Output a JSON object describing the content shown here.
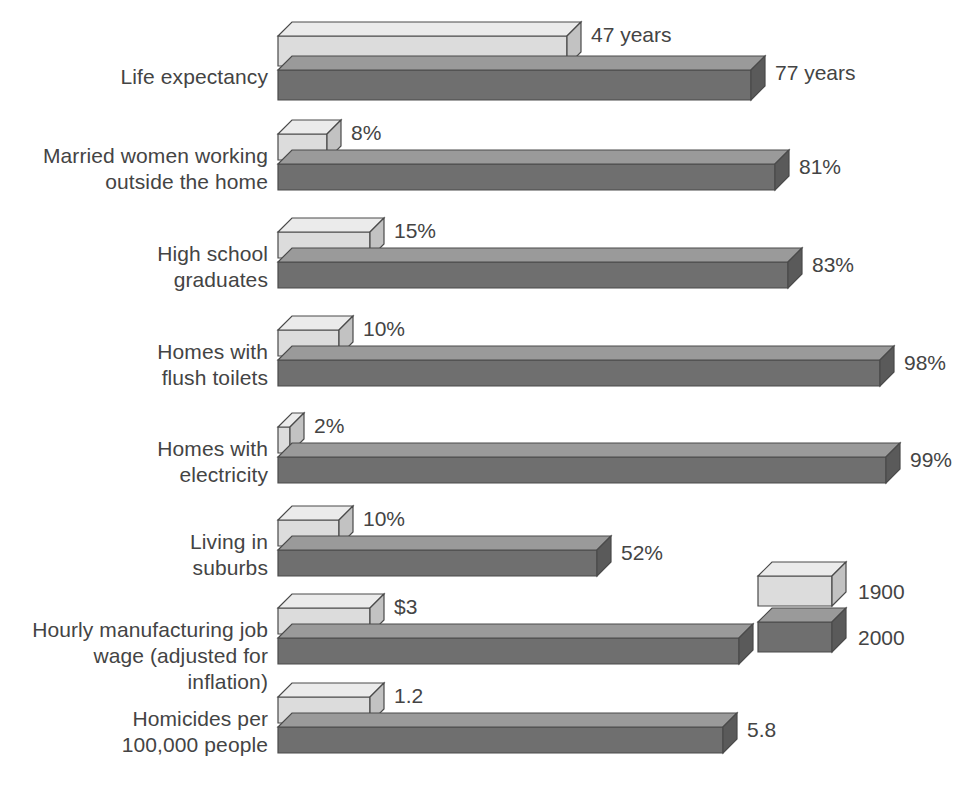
{
  "chart_data": {
    "type": "bar",
    "title": "",
    "subtitle": "",
    "xlabel": "",
    "ylabel": "",
    "orientation": "horizontal",
    "grid": false,
    "legend_position": "right-middle",
    "style": "3d-bar",
    "categories": [
      "Life expectancy",
      "Married women working\noutside the home",
      "High school\ngraduates",
      "Homes with\nflush toilets",
      "Homes with\nelectricity",
      "Living in\nsuburbs",
      "Hourly manufacturing job\nwage (adjusted for inflation)",
      "Homicides per\n100,000 people"
    ],
    "units": [
      "years",
      "%",
      "%",
      "%",
      "%",
      "%",
      "dollars",
      "per 100,000"
    ],
    "series": [
      {
        "name": "1900",
        "color": "#dcdcdc",
        "values": [
          47,
          8,
          15,
          10,
          2,
          10,
          3,
          1.2
        ],
        "labels": [
          "47 years",
          "8%",
          "15%",
          "10%",
          "2%",
          "10%",
          "$3",
          "1.2"
        ]
      },
      {
        "name": "2000",
        "color": "#6f6f6f",
        "values": [
          77,
          81,
          83,
          98,
          99,
          52,
          15,
          5.8
        ],
        "labels": [
          "77 years",
          "81%",
          "83%",
          "98%",
          "99%",
          "52%",
          "$15",
          "5.8"
        ]
      }
    ],
    "scale_max_per_category": [
      100,
      100,
      100,
      100,
      100,
      100,
      20,
      8
    ]
  },
  "legend": {
    "entries": [
      {
        "label": "1900",
        "color": "#dcdcdc"
      },
      {
        "label": "2000",
        "color": "#6f6f6f"
      }
    ]
  },
  "colors": {
    "bar_1900_front": "#dcdcdc",
    "bar_1900_top": "#ebebeb",
    "bar_1900_side": "#c2c2c2",
    "bar_2000_front": "#6f6f6f",
    "bar_2000_top": "#9a9a9a",
    "bar_2000_side": "#5a5a5a",
    "outline": "#4a4a4a",
    "text": "#444444",
    "background": "#ffffff"
  }
}
